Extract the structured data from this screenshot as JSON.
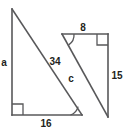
{
  "figure": {
    "background_color": "#ffffff",
    "stroke_color": "#58585a",
    "label_color": "#231f20",
    "shapes": [
      {
        "name": "left-triangle",
        "vertices": [
          [
            12,
            9
          ],
          [
            12,
            115
          ],
          [
            82,
            115
          ]
        ],
        "right_angle_at": [
          12,
          115
        ],
        "angle_arc_at": [
          82,
          115
        ],
        "labels": {
          "vertical_leg": "a",
          "hypotenuse": "34",
          "horizontal_leg": "16"
        }
      },
      {
        "name": "right-triangle",
        "vertices": [
          [
            62,
            34
          ],
          [
            108,
            34
          ],
          [
            108,
            117
          ]
        ],
        "right_angle_at": [
          108,
          34
        ],
        "angle_arc_at": [
          62,
          34
        ],
        "labels": {
          "top_leg": "8",
          "vertical_leg": "15",
          "hypotenuse": "c"
        }
      }
    ]
  },
  "labels": {
    "a": "a",
    "thirty_four": "34",
    "sixteen": "16",
    "eight": "8",
    "fifteen": "15",
    "c": "c"
  }
}
